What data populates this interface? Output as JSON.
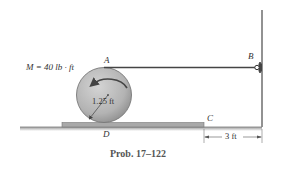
{
  "figure": {
    "caption": "Prob. 17–122",
    "moment_label": "M = 40 lb · ft",
    "moment_direction": "counterclockwise",
    "radius_label": "1.25 ft",
    "distance_label": "3 ft",
    "points": {
      "A": "A",
      "B": "B",
      "C": "C",
      "D": "D"
    },
    "colors": {
      "disk_fill": "#b8b8b8",
      "disk_edge": "#777777",
      "plank_fill": "#a9a9a9",
      "wall": "#777777",
      "cable": "#444444",
      "text": "#333333"
    }
  }
}
